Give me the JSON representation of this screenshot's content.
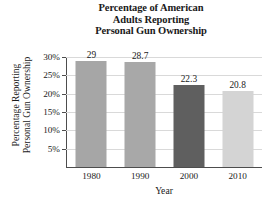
{
  "chart_data": {
    "type": "bar",
    "title": "Percentage of American Adults Reporting Personal Gun Ownership",
    "title_lines": [
      "Percentage of American",
      "Adults Reporting",
      "Personal Gun Ownership"
    ],
    "xlabel": "Year",
    "ylabel": "Percentage Reporting Personal Gun Ownership",
    "ylabel_lines": [
      "Percentage Reporting",
      "Personal Gun Ownership"
    ],
    "categories": [
      "1980",
      "1990",
      "2000",
      "2010"
    ],
    "values": [
      29,
      28.7,
      22.3,
      20.8
    ],
    "value_labels": [
      "29",
      "28.7",
      "22.3",
      "20.8"
    ],
    "bar_colors": [
      "#a6a6a6",
      "#a8a8a8",
      "#5f5f5f",
      "#d4d4d4"
    ],
    "ylim": [
      0,
      30
    ],
    "ytick_values": [
      30,
      25,
      20,
      15,
      10,
      5
    ],
    "ytick_labels": [
      "30%",
      "25%",
      "20%",
      "15%",
      "10%",
      "5%"
    ],
    "grid": true,
    "legend": false,
    "axis_color": "#4d4d4d",
    "gridline_color": "#d9d9d9",
    "background": "#ffffff"
  }
}
